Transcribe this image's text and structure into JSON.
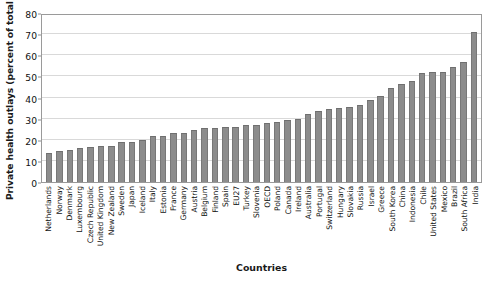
{
  "chart_data": {
    "type": "bar",
    "title": "",
    "xlabel": "Countries",
    "ylabel": "Private health outlays (percent of total)",
    "ylim": [
      0,
      80
    ],
    "yticks": [
      0,
      10,
      20,
      30,
      40,
      50,
      60,
      70,
      80
    ],
    "grid": true,
    "legend": "none",
    "bar_color": "#8c8c8c",
    "categories": [
      "Netherlands",
      "Norway",
      "Denmark",
      "Luxembourg",
      "Czech Republic",
      "United Kingdom",
      "New Zealand",
      "Sweden",
      "Japan",
      "Iceland",
      "Italy",
      "Estonia",
      "France",
      "Germany",
      "Austria",
      "Belgium",
      "Finland",
      "Spain",
      "EU27",
      "Turkey",
      "Slovenia",
      "OECD",
      "Poland",
      "Canada",
      "Ireland",
      "Australia",
      "Portugal",
      "Switzerland",
      "Hungary",
      "Slovakia",
      "Russia",
      "Israel",
      "Greece",
      "South Korea",
      "China",
      "Indonesia",
      "Chile",
      "United States",
      "Mexico",
      "Brazil",
      "South Africa",
      "India"
    ],
    "values": [
      13.5,
      14.8,
      15.0,
      16.0,
      16.5,
      17.0,
      17.2,
      19.0,
      19.0,
      20.0,
      22.0,
      22.0,
      23.0,
      23.2,
      24.5,
      25.5,
      25.5,
      26.0,
      26.2,
      27.0,
      27.0,
      28.0,
      28.5,
      29.5,
      29.8,
      32.0,
      33.5,
      34.5,
      35.0,
      35.5,
      36.5,
      39.0,
      40.5,
      44.5,
      46.5,
      48.0,
      51.5,
      52.0,
      52.2,
      54.5,
      57.0,
      71.0
    ]
  },
  "axis": {
    "y_title": "Private health outlays (percent of total)",
    "x_title": "Countries"
  }
}
